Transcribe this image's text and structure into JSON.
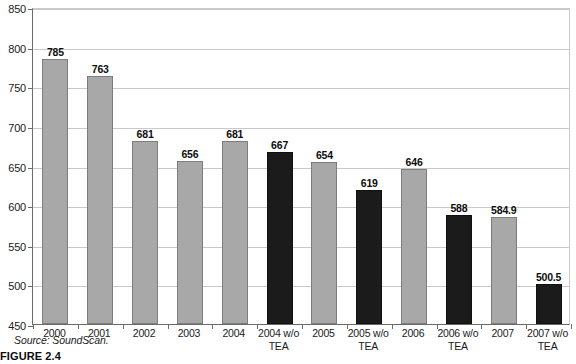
{
  "figure": {
    "caption": "FIGURE 2.4",
    "source_note": "Source: SoundScan."
  },
  "chart_data": {
    "type": "bar",
    "title": "",
    "xlabel": "",
    "ylabel": "",
    "ylim": [
      450,
      850
    ],
    "ytick_step": 50,
    "yticks": [
      450,
      500,
      550,
      600,
      650,
      700,
      750,
      800,
      850
    ],
    "ytick_labels": [
      "450",
      "500",
      "550",
      "600",
      "650",
      "700",
      "750",
      "800",
      "850"
    ],
    "grid": true,
    "legend": "none",
    "categories": [
      "2000",
      "2001",
      "2002",
      "2003",
      "2004",
      "2004 w/o TEA",
      "2005",
      "2005 w/o TEA",
      "2006",
      "2006 w/o TEA",
      "2007",
      "2007 w/o TEA"
    ],
    "values": [
      785,
      763,
      681,
      656,
      681,
      667,
      654,
      619,
      646,
      588,
      584.9,
      500.5
    ],
    "value_labels": [
      "785",
      "763",
      "681",
      "656",
      "681",
      "667",
      "654",
      "619",
      "646",
      "588",
      "584.9",
      "500.5"
    ],
    "bar_styles": [
      "light",
      "light",
      "light",
      "light",
      "light",
      "dark",
      "light",
      "dark",
      "light",
      "dark",
      "light",
      "dark"
    ],
    "colors": {
      "light_bar": "#a8a8a8",
      "light_bar_edge": "#7d7d7d",
      "dark_bar": "#1b1b1b",
      "dark_bar_edge": "#111111",
      "gridline": "#c9c9c9",
      "axis": "#6b6b6b",
      "text": "#1a1a1a",
      "background": "#ffffff"
    }
  }
}
